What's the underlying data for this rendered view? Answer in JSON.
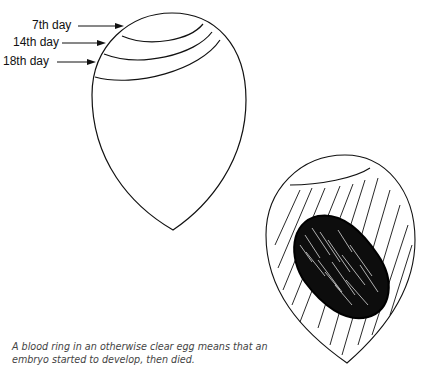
{
  "figure": {
    "labels": [
      {
        "text": "7th day"
      },
      {
        "text": "14th day"
      },
      {
        "text": "18th day"
      }
    ],
    "caption_line1": "A blood ring in an otherwise clear egg means that an",
    "caption_line2": "embryo started to develop, then died.",
    "eggs": [
      {
        "name": "candled-egg-air-cell-stages",
        "description": "Egg outline with air cell lines for 7th, 14th and 18th day"
      },
      {
        "name": "blood-ring-egg",
        "description": "Egg with hatching and dark blood ring blob"
      }
    ],
    "colors": {
      "ink": "#111111",
      "background": "#ffffff",
      "caption": "#444444"
    }
  }
}
